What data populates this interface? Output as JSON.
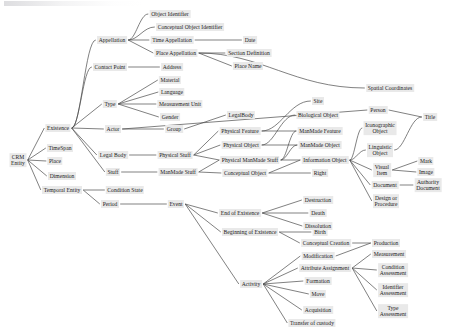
{
  "diagram": {
    "type": "tree-hierarchy",
    "root": "CRM Entity",
    "canvas": {
      "width": 450,
      "height": 335
    },
    "node_style": {
      "fill": "#e9e9e9",
      "text_color": "#1a1a1a"
    },
    "edge_style": {
      "stroke": "#4a4a4a",
      "stroke_width": 0.7
    },
    "nodes": [
      {
        "id": "crm_entity",
        "label": "CRM\nEntity",
        "lines": [
          "CRM",
          "Entity"
        ],
        "x": 18,
        "y": 160,
        "multiline": true
      },
      {
        "id": "existence",
        "label": "Existence",
        "x": 58,
        "y": 128
      },
      {
        "id": "timespan",
        "label": "TimeSpan",
        "x": 60,
        "y": 148
      },
      {
        "id": "place",
        "label": "Place",
        "x": 55,
        "y": 161
      },
      {
        "id": "dimension",
        "label": "Dimension",
        "x": 62,
        "y": 176
      },
      {
        "id": "temporal_entity",
        "label": "Temporal Entity",
        "x": 62,
        "y": 190
      },
      {
        "id": "condition_state",
        "label": "Condition State",
        "x": 125,
        "y": 190
      },
      {
        "id": "period",
        "label": "Period",
        "x": 110,
        "y": 204
      },
      {
        "id": "appellation",
        "label": "Appellation",
        "x": 112,
        "y": 40
      },
      {
        "id": "object_identifier",
        "label": "Object Identifier",
        "x": 170,
        "y": 14
      },
      {
        "id": "conceptual_object_identifier",
        "label": "Conceptual Object Identifier",
        "x": 190,
        "y": 27
      },
      {
        "id": "time_appellation",
        "label": "Time Appellation",
        "x": 172,
        "y": 40
      },
      {
        "id": "date",
        "label": "Date",
        "x": 250,
        "y": 40
      },
      {
        "id": "place_appellation",
        "label": "Place Appellation",
        "x": 176,
        "y": 53
      },
      {
        "id": "section_definition",
        "label": "Section Definition",
        "x": 249,
        "y": 53
      },
      {
        "id": "place_name",
        "label": "Place Name",
        "x": 248,
        "y": 66
      },
      {
        "id": "contact_point",
        "label": "Contact Point",
        "x": 110,
        "y": 67
      },
      {
        "id": "address",
        "label": "Address",
        "x": 172,
        "y": 67
      },
      {
        "id": "material",
        "label": "Material",
        "x": 170,
        "y": 80
      },
      {
        "id": "language",
        "label": "Language",
        "x": 172,
        "y": 92
      },
      {
        "id": "type",
        "label": "Type",
        "x": 110,
        "y": 104
      },
      {
        "id": "measurement_unit",
        "label": "Measurement Unit",
        "x": 180,
        "y": 104
      },
      {
        "id": "gender",
        "label": "Gender",
        "x": 170,
        "y": 117
      },
      {
        "id": "actor",
        "label": "Actor",
        "x": 113,
        "y": 129
      },
      {
        "id": "group",
        "label": "Group",
        "x": 174,
        "y": 129
      },
      {
        "id": "legal_body_space",
        "label": "Legal Body",
        "x": 113,
        "y": 155
      },
      {
        "id": "legalbody",
        "label": "LegalBody",
        "x": 241,
        "y": 115
      },
      {
        "id": "stuff",
        "label": "Stuff",
        "x": 113,
        "y": 172
      },
      {
        "id": "physical_stuff",
        "label": "Physical Stuff",
        "x": 175,
        "y": 155
      },
      {
        "id": "manmade_stuff",
        "label": "ManMade Stuff",
        "x": 178,
        "y": 172
      },
      {
        "id": "site",
        "label": "Site",
        "x": 318,
        "y": 101
      },
      {
        "id": "spatial_coordinates",
        "label": "Spatial Coordinates",
        "x": 390,
        "y": 88
      },
      {
        "id": "biological_object",
        "label": "Biological Object",
        "x": 318,
        "y": 115
      },
      {
        "id": "person",
        "label": "Person",
        "x": 378,
        "y": 110
      },
      {
        "id": "title",
        "label": "Title",
        "x": 430,
        "y": 117
      },
      {
        "id": "physical_feature",
        "label": "Physical Feature",
        "x": 240,
        "y": 131
      },
      {
        "id": "manmade_feature",
        "label": "ManMade Feature",
        "x": 320,
        "y": 131
      },
      {
        "id": "iconographic_object",
        "label": "Iconographic\nObject",
        "lines": [
          "Iconographic",
          "Object"
        ],
        "x": 380,
        "y": 128,
        "multiline": true
      },
      {
        "id": "physical_object",
        "label": "Physical Object",
        "x": 241,
        "y": 145
      },
      {
        "id": "manmade_object",
        "label": "ManMade Object",
        "x": 320,
        "y": 145
      },
      {
        "id": "linguistic_object",
        "label": "Linguistic\nObject",
        "lines": [
          "Linguistic",
          "Object"
        ],
        "x": 380,
        "y": 150,
        "multiline": true
      },
      {
        "id": "physical_manmade_stuff",
        "label": "Physical ManMade Stuff",
        "x": 250,
        "y": 160
      },
      {
        "id": "information_object",
        "label": "Information Object",
        "x": 325,
        "y": 160
      },
      {
        "id": "visual_item",
        "label": "Visual\nItem",
        "lines": [
          "Visual",
          "Item"
        ],
        "x": 382,
        "y": 170,
        "multiline": true
      },
      {
        "id": "mark",
        "label": "Mark",
        "x": 426,
        "y": 161
      },
      {
        "id": "image",
        "label": "Image",
        "x": 426,
        "y": 172
      },
      {
        "id": "conceptual_object",
        "label": "Conceptual Object",
        "x": 245,
        "y": 173
      },
      {
        "id": "right",
        "label": "Right",
        "x": 320,
        "y": 173
      },
      {
        "id": "document",
        "label": "Document",
        "x": 385,
        "y": 185
      },
      {
        "id": "authority_document",
        "label": "Authority\nDocument",
        "lines": [
          "Authority",
          "Document"
        ],
        "x": 428,
        "y": 185,
        "multiline": true
      },
      {
        "id": "design_or_procedure",
        "label": "Design or\nProcedure",
        "lines": [
          "Design or",
          "Procedure"
        ],
        "x": 386,
        "y": 201,
        "multiline": true
      },
      {
        "id": "event",
        "label": "Event",
        "x": 176,
        "y": 204
      },
      {
        "id": "end_of_existence",
        "label": "End of Existence",
        "x": 240,
        "y": 213
      },
      {
        "id": "destruction",
        "label": "Destruction",
        "x": 318,
        "y": 200
      },
      {
        "id": "death",
        "label": "Death",
        "x": 318,
        "y": 213
      },
      {
        "id": "dissolution",
        "label": "Dissolution",
        "x": 318,
        "y": 226
      },
      {
        "id": "beginning_of_existence",
        "label": "Beginning of Existence",
        "x": 250,
        "y": 232
      },
      {
        "id": "birth",
        "label": "Birth",
        "x": 320,
        "y": 232
      },
      {
        "id": "conceptual_creation",
        "label": "Conceptual Creation",
        "x": 326,
        "y": 243
      },
      {
        "id": "production",
        "label": "Production",
        "x": 386,
        "y": 243
      },
      {
        "id": "modification",
        "label": "Modification",
        "x": 318,
        "y": 256
      },
      {
        "id": "measurement",
        "label": "Measurement",
        "x": 389,
        "y": 254
      },
      {
        "id": "attribute_assignment",
        "label": "Attribute Assignment",
        "x": 325,
        "y": 268
      },
      {
        "id": "condition_assessment",
        "label": "Condition\nAssessment",
        "lines": [
          "Condition",
          "Assessment"
        ],
        "x": 393,
        "y": 270,
        "multiline": true
      },
      {
        "id": "activity",
        "label": "Activity",
        "x": 251,
        "y": 284
      },
      {
        "id": "formation",
        "label": "Formation",
        "x": 318,
        "y": 281
      },
      {
        "id": "identifier_assessment",
        "label": "Identifier\nAssessment",
        "lines": [
          "Identifier",
          "Assessment"
        ],
        "x": 393,
        "y": 290,
        "multiline": true
      },
      {
        "id": "move",
        "label": "Move",
        "x": 318,
        "y": 294
      },
      {
        "id": "acquisition",
        "label": "Acquisition",
        "x": 318,
        "y": 310
      },
      {
        "id": "type_assessment",
        "label": "Type\nAssessment",
        "lines": [
          "Type",
          "Assessment"
        ],
        "x": 393,
        "y": 311,
        "multiline": true
      },
      {
        "id": "transfer_of_custody",
        "label": "Transfer of custody",
        "x": 312,
        "y": 323
      }
    ],
    "edges": [
      {
        "from": "crm_entity",
        "to": "existence"
      },
      {
        "from": "crm_entity",
        "to": "timespan"
      },
      {
        "from": "crm_entity",
        "to": "place"
      },
      {
        "from": "crm_entity",
        "to": "dimension"
      },
      {
        "from": "crm_entity",
        "to": "temporal_entity"
      },
      {
        "from": "temporal_entity",
        "to": "condition_state"
      },
      {
        "from": "temporal_entity",
        "to": "period"
      },
      {
        "from": "period",
        "to": "event"
      },
      {
        "from": "existence",
        "to": "appellation"
      },
      {
        "from": "existence",
        "to": "contact_point"
      },
      {
        "from": "existence",
        "to": "type"
      },
      {
        "from": "existence",
        "to": "actor"
      },
      {
        "from": "existence",
        "to": "legal_body_space"
      },
      {
        "from": "existence",
        "to": "stuff"
      },
      {
        "from": "appellation",
        "to": "object_identifier"
      },
      {
        "from": "appellation",
        "to": "conceptual_object_identifier"
      },
      {
        "from": "appellation",
        "to": "time_appellation"
      },
      {
        "from": "appellation",
        "to": "place_appellation"
      },
      {
        "from": "time_appellation",
        "to": "date"
      },
      {
        "from": "place_appellation",
        "to": "section_definition"
      },
      {
        "from": "place_appellation",
        "to": "place_name"
      },
      {
        "from": "place_appellation",
        "to": "spatial_coordinates"
      },
      {
        "from": "contact_point",
        "to": "address"
      },
      {
        "from": "type",
        "to": "material"
      },
      {
        "from": "type",
        "to": "language"
      },
      {
        "from": "type",
        "to": "measurement_unit"
      },
      {
        "from": "type",
        "to": "gender"
      },
      {
        "from": "actor",
        "to": "group"
      },
      {
        "from": "actor",
        "to": "person"
      },
      {
        "from": "group",
        "to": "legalbody"
      },
      {
        "from": "legal_body_space",
        "to": "physical_stuff"
      },
      {
        "from": "physical_stuff",
        "to": "physical_feature"
      },
      {
        "from": "physical_stuff",
        "to": "physical_object"
      },
      {
        "from": "physical_stuff",
        "to": "physical_manmade_stuff"
      },
      {
        "from": "stuff",
        "to": "manmade_stuff"
      },
      {
        "from": "manmade_stuff",
        "to": "physical_manmade_stuff"
      },
      {
        "from": "manmade_stuff",
        "to": "conceptual_object"
      },
      {
        "from": "physical_feature",
        "to": "site"
      },
      {
        "from": "physical_feature",
        "to": "manmade_feature"
      },
      {
        "from": "physical_object",
        "to": "biological_object"
      },
      {
        "from": "physical_object",
        "to": "manmade_object"
      },
      {
        "from": "physical_manmade_stuff",
        "to": "manmade_feature"
      },
      {
        "from": "physical_manmade_stuff",
        "to": "manmade_object"
      },
      {
        "from": "physical_manmade_stuff",
        "to": "information_object"
      },
      {
        "from": "conceptual_object",
        "to": "information_object"
      },
      {
        "from": "conceptual_object",
        "to": "right"
      },
      {
        "from": "person",
        "to": "title"
      },
      {
        "from": "information_object",
        "to": "iconographic_object"
      },
      {
        "from": "information_object",
        "to": "linguistic_object"
      },
      {
        "from": "information_object",
        "to": "visual_item"
      },
      {
        "from": "information_object",
        "to": "document"
      },
      {
        "from": "information_object",
        "to": "design_or_procedure"
      },
      {
        "from": "linguistic_object",
        "to": "title"
      },
      {
        "from": "visual_item",
        "to": "mark"
      },
      {
        "from": "visual_item",
        "to": "image"
      },
      {
        "from": "document",
        "to": "authority_document"
      },
      {
        "from": "event",
        "to": "end_of_existence"
      },
      {
        "from": "event",
        "to": "beginning_of_existence"
      },
      {
        "from": "event",
        "to": "activity"
      },
      {
        "from": "end_of_existence",
        "to": "destruction"
      },
      {
        "from": "end_of_existence",
        "to": "death"
      },
      {
        "from": "end_of_existence",
        "to": "dissolution"
      },
      {
        "from": "beginning_of_existence",
        "to": "birth"
      },
      {
        "from": "beginning_of_existence",
        "to": "conceptual_creation"
      },
      {
        "from": "conceptual_creation",
        "to": "production"
      },
      {
        "from": "activity",
        "to": "modification"
      },
      {
        "from": "activity",
        "to": "attribute_assignment"
      },
      {
        "from": "activity",
        "to": "formation"
      },
      {
        "from": "activity",
        "to": "move"
      },
      {
        "from": "activity",
        "to": "acquisition"
      },
      {
        "from": "activity",
        "to": "transfer_of_custody"
      },
      {
        "from": "modification",
        "to": "production"
      },
      {
        "from": "attribute_assignment",
        "to": "measurement"
      },
      {
        "from": "attribute_assignment",
        "to": "condition_assessment"
      },
      {
        "from": "attribute_assignment",
        "to": "identifier_assessment"
      },
      {
        "from": "attribute_assignment",
        "to": "type_assessment"
      }
    ],
    "curved_edges": [
      {
        "from": "existence",
        "to": "appellation"
      },
      {
        "from": "existence",
        "to": "contact_point"
      },
      {
        "from": "appellation",
        "to": "object_identifier"
      },
      {
        "from": "appellation",
        "to": "conceptual_object_identifier"
      },
      {
        "from": "place_appellation",
        "to": "spatial_coordinates"
      },
      {
        "from": "physical_feature",
        "to": "site"
      },
      {
        "from": "physical_object",
        "to": "biological_object"
      },
      {
        "from": "physical_manmade_stuff",
        "to": "manmade_feature"
      },
      {
        "from": "physical_manmade_stuff",
        "to": "manmade_object"
      },
      {
        "from": "information_object",
        "to": "iconographic_object"
      },
      {
        "from": "information_object",
        "to": "linguistic_object"
      },
      {
        "from": "linguistic_object",
        "to": "title"
      }
    ]
  }
}
